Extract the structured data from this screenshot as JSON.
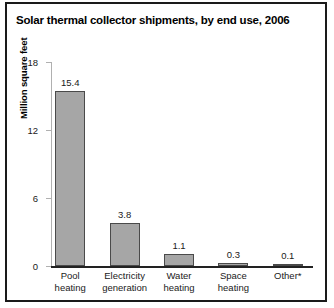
{
  "figure": {
    "title": "Solar thermal collector shipments, by end use, 2006",
    "border_color": "#1a1a1a",
    "background": "#ffffff"
  },
  "chart_data": {
    "type": "bar",
    "title": "Solar thermal collector shipments, by end use, 2006",
    "xlabel": "",
    "ylabel": "Million square feet",
    "categories": [
      "Pool heating",
      "Electricity generation",
      "Water heating",
      "Space heating",
      "Other*"
    ],
    "category_lines": [
      [
        "Pool",
        "heating"
      ],
      [
        "Electricity",
        "generation"
      ],
      [
        "Water",
        "heating"
      ],
      [
        "Space",
        "heating"
      ],
      [
        "Other*"
      ]
    ],
    "values": [
      15.4,
      3.8,
      1.1,
      0.3,
      0.1
    ],
    "value_labels": [
      "15.4",
      "3.8",
      "1.1",
      "0.3",
      "0.1"
    ],
    "ylim": [
      0,
      18
    ],
    "yticks": [
      0,
      6,
      12,
      18
    ],
    "ytick_labels": [
      "0",
      "6",
      "12",
      "18"
    ],
    "grid": false,
    "legend": null,
    "bar_color": "#a6a6a6",
    "bar_edge_color": "#4a4a4a",
    "axis_color": "#b0b0b0",
    "baseline_color": "#222222"
  }
}
